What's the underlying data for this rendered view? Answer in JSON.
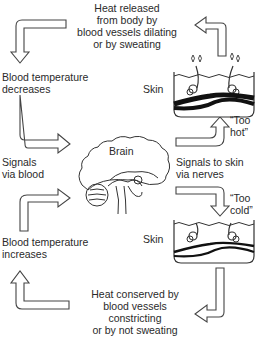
{
  "diagram": {
    "top_caption": [
      "Heat released",
      "from body by",
      "blood vessels dilating",
      "or by sweating"
    ],
    "left_top": [
      "Blood temperature",
      "decreases"
    ],
    "left_mid": [
      "Signals",
      "via blood"
    ],
    "left_bottom": [
      "Blood temperature",
      "increases"
    ],
    "brain_label": "Brain",
    "skin_top_label": "Skin",
    "skin_bottom_label": "Skin",
    "too_hot": [
      "“Too",
      "hot”"
    ],
    "too_cold": [
      "“Too",
      "cold”"
    ],
    "right_mid": [
      "Signals to skin",
      "via nerves"
    ],
    "bottom_caption": [
      "Heat conserved by",
      "blood vessels",
      "constricting",
      "or by not sweating"
    ]
  },
  "icons": {
    "brain": "brain-cross-section-icon",
    "skin_hot": "skin-sweating-icon",
    "skin_cold": "skin-constricted-icon"
  },
  "colors": {
    "line": "#444444",
    "text": "#2a2a2a",
    "vessel": "#111111"
  }
}
